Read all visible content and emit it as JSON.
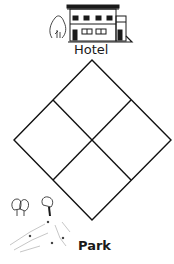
{
  "diagram": {
    "type": "grid-diamond",
    "rows": 2,
    "cols": 2,
    "vertices": {
      "top": [
        92,
        60
      ],
      "right": [
        171,
        140
      ],
      "bottom": [
        92,
        220
      ],
      "left": [
        14,
        140
      ]
    },
    "line_color": "#111111"
  },
  "landmarks": {
    "top": {
      "label": "Hotel",
      "icon": "hotel-building-icon"
    },
    "bottom": {
      "label": "Park",
      "icon": "park-trees-icon"
    }
  }
}
